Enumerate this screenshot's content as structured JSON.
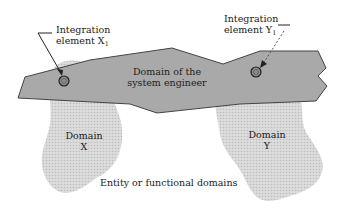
{
  "diagram": {
    "band": {
      "label_line1": "Domain of the",
      "label_line2": "system engineer",
      "fill": "#a9a9a9",
      "stroke": "#444444"
    },
    "domains": [
      {
        "label_line1": "Domain",
        "label_line2": "X"
      },
      {
        "label_line1": "Domain",
        "label_line2": "Y"
      }
    ],
    "domain_fill": "#d4d4d4",
    "integration_elements": [
      {
        "label_line1": "Integration",
        "label_line2": "element X",
        "subscript": "1",
        "arrow_style": "solid"
      },
      {
        "label_line1": "Integration",
        "label_line2": "element Y",
        "subscript": "1",
        "arrow_style": "dashed"
      }
    ],
    "caption": "Entity or functional domains"
  }
}
